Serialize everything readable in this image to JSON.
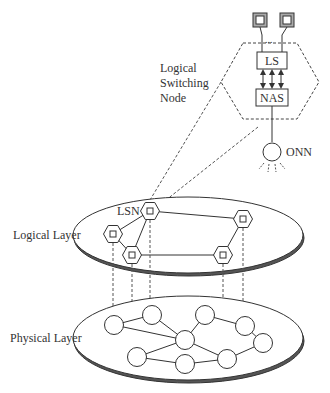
{
  "labels": {
    "logical_switching_node": [
      "Logical",
      "Switching",
      "Node"
    ],
    "ls": "LS",
    "nas": "NAS",
    "onn": "ONN",
    "lsn": "LSN",
    "logical_layer": "Logical Layer",
    "physical_layer": "Physical Layer",
    "ellipsis": "..."
  },
  "icons": {
    "port_box": "square-in-square",
    "logical_node": "hexagon-with-square",
    "physical_node": "circle",
    "onn_node": "circle-with-rays"
  },
  "colors": {
    "stroke": "#333333",
    "port_fill": "#aaaaaa",
    "background": "#ffffff"
  },
  "logical_layer": {
    "nodes": [
      {
        "id": "lsn",
        "label": "LSN"
      },
      {
        "id": "l2"
      },
      {
        "id": "l3"
      },
      {
        "id": "l4"
      },
      {
        "id": "l5"
      }
    ],
    "edges": [
      [
        "lsn",
        "l2"
      ],
      [
        "lsn",
        "l3"
      ],
      [
        "lsn",
        "l4"
      ],
      [
        "l2",
        "l3"
      ],
      [
        "l3",
        "l5"
      ],
      [
        "l4",
        "l5"
      ]
    ]
  },
  "physical_layer": {
    "nodes": [
      "p1",
      "p2",
      "p3",
      "p4",
      "p5",
      "p6",
      "p7",
      "p8",
      "p9"
    ],
    "edges": [
      [
        "p1",
        "p2"
      ],
      [
        "p1",
        "p6"
      ],
      [
        "p2",
        "p6"
      ],
      [
        "p3",
        "p6"
      ],
      [
        "p3",
        "p4"
      ],
      [
        "p4",
        "p5"
      ],
      [
        "p6",
        "p7"
      ],
      [
        "p6",
        "p9"
      ],
      [
        "p7",
        "p8"
      ],
      [
        "p8",
        "p9"
      ],
      [
        "p9",
        "p5"
      ]
    ]
  },
  "mapping": {
    "vertical_links": [
      [
        "l2",
        "p1"
      ],
      [
        "l3",
        "p7"
      ],
      [
        "lsn",
        "p2"
      ],
      [
        "l5",
        "p9"
      ],
      [
        "l4",
        "p4"
      ]
    ]
  }
}
